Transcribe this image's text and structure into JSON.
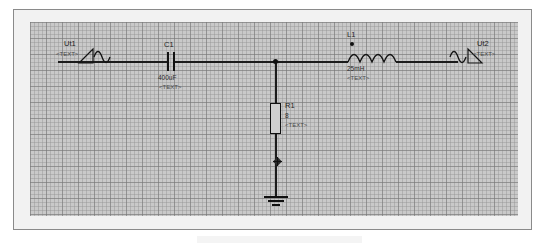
{
  "window": {
    "background_color": "#ffffff",
    "frame_border_color": "#8a8a8a",
    "canvas_background_color": "#c9c9c9",
    "grid_line_color": "#787878",
    "wire_color": "#1b1b1b"
  },
  "schematic": {
    "title": "",
    "components": [
      {
        "id": "Ut1",
        "type": "ac-voltage-source",
        "ref_label": "Ut1",
        "value_label": "",
        "text_label": "<TEXT>",
        "x": 84,
        "y": 62
      },
      {
        "id": "C1",
        "type": "capacitor",
        "ref_label": "C1",
        "value_label": "400uF",
        "text_label": "<TEXT>",
        "x": 170,
        "y": 62
      },
      {
        "id": "L1",
        "type": "inductor",
        "ref_label": "L1",
        "value_label": "25mH",
        "text_label": "<TEXT>",
        "x": 348,
        "y": 62
      },
      {
        "id": "R1",
        "type": "resistor",
        "ref_label": "R1",
        "value_label": "8",
        "text_label": "<TEXT>",
        "x": 275,
        "y": 118
      },
      {
        "id": "Ut2",
        "type": "ac-voltage-source",
        "ref_label": "Ut2",
        "value_label": "",
        "text_label": "<TEXT>",
        "x": 458,
        "y": 62
      },
      {
        "id": "GND1",
        "type": "ground",
        "ref_label": "",
        "value_label": "",
        "text_label": "",
        "x": 275,
        "y": 196
      }
    ],
    "probe": {
      "name": "node-probe-marker",
      "x": 277,
      "y": 156
    }
  }
}
